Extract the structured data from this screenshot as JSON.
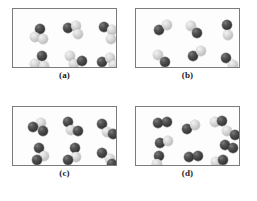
{
  "figure": {
    "title": "",
    "background_color": "#ffffff",
    "panel_border_color": "#7b7b7b",
    "panel_fill_color": "#fdfdfd",
    "dark_atom_color": "#3b3b3b",
    "light_atom_color": "#c4c4c4",
    "atom_diameter_px": 10,
    "panel_count": 4
  },
  "panels": [
    {
      "label": "(a)",
      "box": {
        "x": 12,
        "y": 8,
        "w": 105,
        "h": 60
      },
      "label_y": 70,
      "composition": "one dark atom with two light atoms",
      "molecule_count": 6,
      "molecules": [
        {
          "atoms": [
            {
              "type": "dark",
              "x": 22,
              "y": 15
            },
            {
              "type": "light",
              "x": 17,
              "y": 23
            },
            {
              "type": "light",
              "x": 25,
              "y": 25
            }
          ]
        },
        {
          "atoms": [
            {
              "type": "dark",
              "x": 50,
              "y": 14
            },
            {
              "type": "light",
              "x": 58,
              "y": 12
            },
            {
              "type": "light",
              "x": 60,
              "y": 20
            }
          ]
        },
        {
          "atoms": [
            {
              "type": "dark",
              "x": 86,
              "y": 13
            },
            {
              "type": "light",
              "x": 94,
              "y": 16
            },
            {
              "type": "light",
              "x": 93,
              "y": 25
            }
          ]
        },
        {
          "atoms": [
            {
              "type": "dark",
              "x": 24,
              "y": 42
            },
            {
              "type": "light",
              "x": 17,
              "y": 50
            },
            {
              "type": "light",
              "x": 26,
              "y": 52
            }
          ]
        },
        {
          "atoms": [
            {
              "type": "light",
              "x": 52,
              "y": 42
            },
            {
              "type": "light",
              "x": 56,
              "y": 50
            },
            {
              "type": "dark",
              "x": 64,
              "y": 47
            }
          ]
        },
        {
          "atoms": [
            {
              "type": "dark",
              "x": 84,
              "y": 48
            },
            {
              "type": "light",
              "x": 92,
              "y": 44
            },
            {
              "type": "light",
              "x": 96,
              "y": 51
            }
          ]
        }
      ]
    },
    {
      "label": "(b)",
      "box": {
        "x": 135,
        "y": 8,
        "w": 105,
        "h": 60
      },
      "label_y": 70,
      "composition": "one dark atom bonded to one light atom",
      "molecule_count": 6,
      "molecules": [
        {
          "atoms": [
            {
              "type": "dark",
              "x": 18,
              "y": 16
            },
            {
              "type": "light",
              "x": 26,
              "y": 11
            }
          ]
        },
        {
          "atoms": [
            {
              "type": "light",
              "x": 50,
              "y": 12
            },
            {
              "type": "dark",
              "x": 56,
              "y": 19
            }
          ]
        },
        {
          "atoms": [
            {
              "type": "dark",
              "x": 86,
              "y": 11
            },
            {
              "type": "light",
              "x": 87,
              "y": 21
            }
          ]
        },
        {
          "atoms": [
            {
              "type": "light",
              "x": 17,
              "y": 41
            },
            {
              "type": "dark",
              "x": 24,
              "y": 48
            }
          ]
        },
        {
          "atoms": [
            {
              "type": "dark",
              "x": 52,
              "y": 42
            },
            {
              "type": "light",
              "x": 60,
              "y": 37
            }
          ]
        },
        {
          "atoms": [
            {
              "type": "dark",
              "x": 85,
              "y": 44
            },
            {
              "type": "light",
              "x": 92,
              "y": 51
            }
          ]
        }
      ]
    },
    {
      "label": "(c)",
      "box": {
        "x": 12,
        "y": 106,
        "w": 105,
        "h": 60
      },
      "label_y": 168,
      "composition": "two dark atoms with one light atom",
      "molecule_count": 6,
      "molecules": [
        {
          "atoms": [
            {
              "type": "light",
              "x": 23,
              "y": 11
            },
            {
              "type": "dark",
              "x": 15,
              "y": 15
            },
            {
              "type": "dark",
              "x": 25,
              "y": 19
            }
          ]
        },
        {
          "atoms": [
            {
              "type": "dark",
              "x": 50,
              "y": 10
            },
            {
              "type": "light",
              "x": 53,
              "y": 18
            },
            {
              "type": "dark",
              "x": 60,
              "y": 19
            }
          ]
        },
        {
          "atoms": [
            {
              "type": "dark",
              "x": 84,
              "y": 12
            },
            {
              "type": "light",
              "x": 89,
              "y": 20
            },
            {
              "type": "dark",
              "x": 95,
              "y": 22
            }
          ]
        },
        {
          "atoms": [
            {
              "type": "dark",
              "x": 21,
              "y": 36
            },
            {
              "type": "light",
              "x": 26,
              "y": 44
            },
            {
              "type": "dark",
              "x": 19,
              "y": 48
            }
          ]
        },
        {
          "atoms": [
            {
              "type": "dark",
              "x": 57,
              "y": 36
            },
            {
              "type": "light",
              "x": 58,
              "y": 45
            },
            {
              "type": "dark",
              "x": 50,
              "y": 48
            }
          ]
        },
        {
          "atoms": [
            {
              "type": "dark",
              "x": 84,
              "y": 41
            },
            {
              "type": "light",
              "x": 92,
              "y": 47
            },
            {
              "type": "dark",
              "x": 94,
              "y": 52
            }
          ]
        }
      ]
    },
    {
      "label": "(d)",
      "box": {
        "x": 135,
        "y": 106,
        "w": 105,
        "h": 60
      },
      "label_y": 168,
      "composition": "mixture of dark-dark pairs and dark-light pairs",
      "molecule_count": 9,
      "molecules": [
        {
          "atoms": [
            {
              "type": "dark",
              "x": 17,
              "y": 11
            },
            {
              "type": "dark",
              "x": 26,
              "y": 10
            }
          ]
        },
        {
          "atoms": [
            {
              "type": "dark",
              "x": 46,
              "y": 17
            },
            {
              "type": "light",
              "x": 54,
              "y": 13
            }
          ]
        },
        {
          "atoms": [
            {
              "type": "light",
              "x": 74,
              "y": 10
            },
            {
              "type": "dark",
              "x": 81,
              "y": 9
            }
          ]
        },
        {
          "atoms": [
            {
              "type": "light",
              "x": 86,
              "y": 19
            },
            {
              "type": "dark",
              "x": 94,
              "y": 23
            }
          ]
        },
        {
          "atoms": [
            {
              "type": "dark",
              "x": 19,
              "y": 31
            },
            {
              "type": "light",
              "x": 27,
              "y": 29
            }
          ]
        },
        {
          "atoms": [
            {
              "type": "dark",
              "x": 18,
              "y": 44
            },
            {
              "type": "light",
              "x": 16,
              "y": 52
            }
          ]
        },
        {
          "atoms": [
            {
              "type": "dark",
              "x": 48,
              "y": 45
            },
            {
              "type": "dark",
              "x": 57,
              "y": 44
            }
          ]
        },
        {
          "atoms": [
            {
              "type": "dark",
              "x": 84,
              "y": 33
            },
            {
              "type": "dark",
              "x": 92,
              "y": 36
            }
          ]
        },
        {
          "atoms": [
            {
              "type": "light",
              "x": 75,
              "y": 50
            },
            {
              "type": "dark",
              "x": 82,
              "y": 48
            }
          ]
        }
      ]
    }
  ]
}
